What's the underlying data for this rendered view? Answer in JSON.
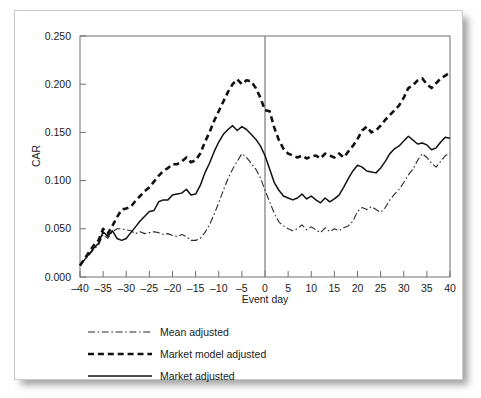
{
  "chart_data": {
    "type": "line",
    "title": "",
    "xlabel": "Event day",
    "ylabel": "CAR",
    "xlim": [
      -40,
      40
    ],
    "ylim": [
      0.0,
      0.25
    ],
    "xticks": [
      -40,
      -35,
      -30,
      -25,
      -20,
      -15,
      -10,
      -5,
      0,
      5,
      10,
      15,
      20,
      25,
      30,
      35,
      40
    ],
    "xtick_labels": [
      "–40",
      "–35",
      "–30",
      "–25",
      "–20",
      "–15",
      "–10",
      "–5",
      "0",
      "5",
      "10",
      "15",
      "20",
      "25",
      "30",
      "35",
      "40"
    ],
    "yticks": [
      0.0,
      0.05,
      0.1,
      0.15,
      0.2,
      0.25
    ],
    "ytick_labels": [
      "0.000",
      "0.050",
      "0.100",
      "0.150",
      "0.200",
      "0.250"
    ],
    "grid": false,
    "legend_position": "below",
    "annotations": [
      {
        "name": "event-day-reference-line",
        "type": "vline",
        "x": 0,
        "color": "#8c8c8c"
      }
    ],
    "x": [
      -40,
      -39,
      -38,
      -37,
      -36,
      -35,
      -34,
      -33,
      -32,
      -31,
      -30,
      -29,
      -28,
      -27,
      -26,
      -25,
      -24,
      -23,
      -22,
      -21,
      -20,
      -19,
      -18,
      -17,
      -16,
      -15,
      -14,
      -13,
      -12,
      -11,
      -10,
      -9,
      -8,
      -7,
      -6,
      -5,
      -4,
      -3,
      -2,
      -1,
      0,
      1,
      2,
      3,
      4,
      5,
      6,
      7,
      8,
      9,
      10,
      11,
      12,
      13,
      14,
      15,
      16,
      17,
      18,
      19,
      20,
      21,
      22,
      23,
      24,
      25,
      26,
      27,
      28,
      29,
      30,
      31,
      32,
      33,
      34,
      35,
      36,
      37,
      38,
      39,
      40
    ],
    "series": [
      {
        "name": "Mean adjusted",
        "style": "dashdot",
        "width": 1.1,
        "color": "#2b2b2b",
        "values": [
          0.012,
          0.018,
          0.023,
          0.029,
          0.033,
          0.044,
          0.04,
          0.047,
          0.05,
          0.05,
          0.049,
          0.048,
          0.045,
          0.047,
          0.045,
          0.046,
          0.047,
          0.046,
          0.044,
          0.045,
          0.043,
          0.042,
          0.044,
          0.042,
          0.038,
          0.038,
          0.04,
          0.046,
          0.054,
          0.065,
          0.077,
          0.09,
          0.102,
          0.112,
          0.12,
          0.128,
          0.124,
          0.118,
          0.112,
          0.103,
          0.09,
          0.078,
          0.066,
          0.057,
          0.053,
          0.05,
          0.048,
          0.05,
          0.054,
          0.049,
          0.052,
          0.049,
          0.046,
          0.051,
          0.047,
          0.05,
          0.048,
          0.051,
          0.053,
          0.058,
          0.068,
          0.072,
          0.07,
          0.073,
          0.07,
          0.067,
          0.072,
          0.08,
          0.086,
          0.091,
          0.098,
          0.106,
          0.112,
          0.121,
          0.128,
          0.124,
          0.118,
          0.114,
          0.12,
          0.126,
          0.128
        ]
      },
      {
        "name": "Market model adjusted",
        "style": "dashed",
        "width": 2.6,
        "color": "#111111",
        "values": [
          0.012,
          0.019,
          0.026,
          0.033,
          0.038,
          0.05,
          0.045,
          0.053,
          0.062,
          0.07,
          0.071,
          0.073,
          0.079,
          0.084,
          0.089,
          0.093,
          0.099,
          0.105,
          0.11,
          0.113,
          0.117,
          0.117,
          0.12,
          0.124,
          0.119,
          0.121,
          0.128,
          0.14,
          0.15,
          0.162,
          0.172,
          0.182,
          0.192,
          0.2,
          0.205,
          0.2,
          0.204,
          0.203,
          0.196,
          0.186,
          0.173,
          0.172,
          0.155,
          0.142,
          0.133,
          0.128,
          0.126,
          0.124,
          0.126,
          0.123,
          0.125,
          0.126,
          0.123,
          0.128,
          0.126,
          0.124,
          0.128,
          0.124,
          0.13,
          0.136,
          0.143,
          0.152,
          0.156,
          0.15,
          0.152,
          0.157,
          0.163,
          0.168,
          0.173,
          0.178,
          0.186,
          0.196,
          0.199,
          0.204,
          0.206,
          0.2,
          0.196,
          0.201,
          0.206,
          0.209,
          0.212
        ]
      },
      {
        "name": "Market adjusted",
        "style": "solid",
        "width": 1.5,
        "color": "#111111",
        "values": [
          0.012,
          0.018,
          0.024,
          0.03,
          0.035,
          0.047,
          0.042,
          0.048,
          0.04,
          0.038,
          0.04,
          0.046,
          0.052,
          0.058,
          0.063,
          0.068,
          0.069,
          0.078,
          0.08,
          0.08,
          0.085,
          0.086,
          0.087,
          0.091,
          0.085,
          0.086,
          0.095,
          0.108,
          0.118,
          0.13,
          0.14,
          0.148,
          0.153,
          0.157,
          0.152,
          0.156,
          0.153,
          0.148,
          0.143,
          0.136,
          0.126,
          0.112,
          0.098,
          0.09,
          0.084,
          0.082,
          0.08,
          0.082,
          0.086,
          0.081,
          0.084,
          0.08,
          0.077,
          0.082,
          0.078,
          0.081,
          0.085,
          0.093,
          0.102,
          0.11,
          0.116,
          0.114,
          0.11,
          0.109,
          0.108,
          0.113,
          0.12,
          0.128,
          0.133,
          0.136,
          0.141,
          0.146,
          0.142,
          0.138,
          0.139,
          0.137,
          0.132,
          0.134,
          0.14,
          0.145,
          0.144
        ]
      }
    ]
  },
  "legend": {
    "items": [
      {
        "label": "Mean adjusted",
        "style": "dashdot"
      },
      {
        "label": "Market model adjusted",
        "style": "dashed"
      },
      {
        "label": "Market adjusted",
        "style": "solid"
      }
    ]
  }
}
